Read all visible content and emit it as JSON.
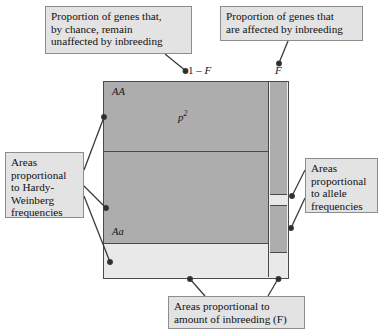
{
  "figure": {
    "axis_top": {
      "left_label_prefix": "1",
      "left_label_minus": " – ",
      "left_label_symbol": "F",
      "right_label_symbol": "F"
    },
    "colors": {
      "dark_fill": "#adadad",
      "light_fill": "#e9e9e9",
      "box_fill": "#e3e3e3",
      "border": "#4a4a4a",
      "callout_border": "#8d8d8d"
    },
    "left_column": {
      "name": "1 - F (unaffected by inbreeding)",
      "cells": [
        {
          "genotype": "AA",
          "frequency": "p",
          "exponent": "2"
        },
        {
          "genotype": "Aa",
          "frequency": "2pq",
          "exponent": ""
        },
        {
          "genotype": "aa",
          "frequency": "q",
          "exponent": "2"
        }
      ]
    },
    "right_column": {
      "name": "F (affected by inbreeding)",
      "cells": [
        {
          "genotype": "AA",
          "frequency": "p"
        },
        {
          "genotype": "aa",
          "frequency": "q"
        }
      ]
    }
  },
  "callouts": {
    "unaffected": "Proportion of genes that,\nby chance, remain\nunaffected by inbreeding",
    "affected": "Proportion of genes that\nare affected by inbreeding",
    "hardy_weinberg": "Areas\nproportional\nto Hardy-\nWeinberg\nfrequencies",
    "allele": "Areas\nproportional\nto allele\nfrequencies",
    "inbreeding": "Areas proportional to\namount of inbreeding (F)"
  }
}
